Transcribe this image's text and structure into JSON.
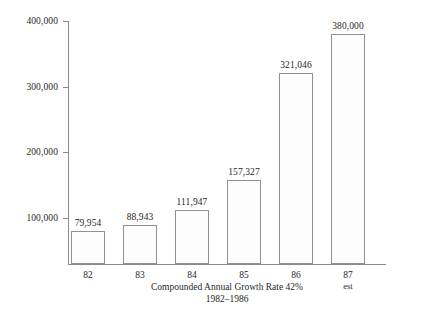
{
  "chart_data": {
    "type": "bar",
    "title": "",
    "subtitle": "",
    "xlabel": "",
    "ylabel": "",
    "categories": [
      "82",
      "83",
      "84",
      "85",
      "86",
      "87"
    ],
    "category_sublabels": [
      "",
      "",
      "",
      "",
      "",
      "est"
    ],
    "values": [
      79954,
      111947,
      88943,
      157327,
      321046,
      380000
    ],
    "value_labels": [
      "79,954",
      "88,943",
      "111,947",
      "157,327",
      "321,046",
      "380,000"
    ],
    "series": [
      {
        "name": "",
        "values": [
          79954,
          88943,
          111947,
          157327,
          321046,
          380000
        ]
      }
    ],
    "ylim": [
      0,
      400000
    ],
    "ytick_values": [
      400000,
      300000,
      200000,
      100000
    ],
    "ytick_labels": [
      "400,000",
      "300,000",
      "200,000",
      "100,000"
    ],
    "grid": false,
    "legend": "none",
    "annotations": {
      "caption_line1": "Compounded Annual Growth Rate 42%",
      "caption_line2": "1982–1986"
    },
    "colors": {
      "bar_fill": "#fdfdfd",
      "bar_border": "#909090",
      "axis": "#8a8a8a",
      "text": "#1f1f1f",
      "background": "#ffffff"
    }
  },
  "bars": [
    {
      "category": "82",
      "sublabel": "",
      "value": 79954,
      "label": "79,954"
    },
    {
      "category": "83",
      "sublabel": "",
      "value": 88943,
      "label": "88,943"
    },
    {
      "category": "84",
      "sublabel": "",
      "value": 111947,
      "label": "111,947"
    },
    {
      "category": "85",
      "sublabel": "",
      "value": 157327,
      "label": "157,327"
    },
    {
      "category": "86",
      "sublabel": "",
      "value": 321046,
      "label": "321,046"
    },
    {
      "category": "87",
      "sublabel": "est",
      "value": 380000,
      "label": "380,000"
    }
  ],
  "yaxis": {
    "ticks": [
      {
        "value": 400000,
        "label": "400,000"
      },
      {
        "value": 300000,
        "label": "300,000"
      },
      {
        "value": 200000,
        "label": "200,000"
      },
      {
        "value": 100000,
        "label": "100,000"
      }
    ]
  },
  "caption": {
    "line1": "Compounded Annual Growth Rate 42%",
    "line2": "1982–1986"
  }
}
